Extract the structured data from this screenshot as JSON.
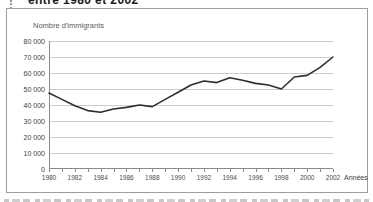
{
  "page": {
    "clipped_title_fragment": "entre 1980 et 2002"
  },
  "chart": {
    "y_axis_title": "Nombre d'immigrants",
    "x_axis_unit_label": "Années",
    "y_tick_labels": [
      "80 000",
      "70 000",
      "60 000",
      "50 000",
      "40 000",
      "30 000",
      "20 000",
      "10 000",
      "0"
    ],
    "x_tick_labels": [
      "1980",
      "1982",
      "1984",
      "1986",
      "1988",
      "1990",
      "1992",
      "1994",
      "1996",
      "1998",
      "2000",
      "2002"
    ],
    "colors": {
      "line": "#2e2e2e",
      "grid": "#cccccc",
      "axis": "#8a8a8a",
      "frame": "#9aa0a0"
    }
  },
  "chart_data": {
    "type": "line",
    "title": "entre 1980 et 2002",
    "xlabel": "Années",
    "ylabel": "Nombre d'immigrants",
    "x": [
      1980,
      1981,
      1982,
      1983,
      1984,
      1985,
      1986,
      1987,
      1988,
      1989,
      1990,
      1991,
      1992,
      1993,
      1994,
      1995,
      1996,
      1997,
      1998,
      1999,
      2000,
      2001,
      2002
    ],
    "values": [
      47500,
      43500,
      39500,
      36500,
      35500,
      37500,
      38500,
      40000,
      39000,
      43500,
      48000,
      52500,
      55000,
      54000,
      57000,
      55500,
      53500,
      52500,
      50000,
      57500,
      58500,
      63500,
      70000
    ],
    "ylim": [
      0,
      80000
    ],
    "y_tick_step": 10000,
    "x_tick_step_years": 1,
    "x_label_every_years": 2,
    "grid": true,
    "legend": "none"
  }
}
